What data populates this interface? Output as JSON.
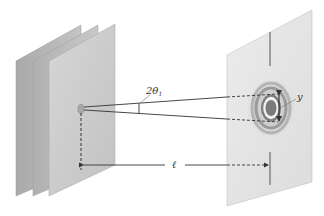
{
  "diagram": {
    "labels": {
      "angle": "2θ",
      "angle_subscript": "1",
      "fringe_width": "y",
      "distance": "ℓ"
    },
    "elements": {
      "plates_count": 3,
      "screen": "observation screen with concentric diffraction rings"
    },
    "colors": {
      "plate_back": "#b3b3b3",
      "plate_mid": "#bdbdbd",
      "plate_front": "#cfcfcf",
      "screen": "#e4e4e4",
      "ring_dark": "#8a8a8a",
      "line": "#444444"
    }
  }
}
